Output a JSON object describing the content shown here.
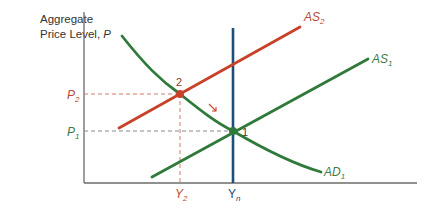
{
  "diagram": {
    "y_axis_title_line1": "Aggregate",
    "y_axis_title_line2": "Price Level, ",
    "y_axis_title_var": "P",
    "colors": {
      "axis": "#6b6b6b",
      "green": "#2f7a3a",
      "red": "#c8422a",
      "blue": "#1f4e7a",
      "dashed_red": "#d07a66",
      "dashed_gray": "#8a8a8a",
      "label_red": "#b94a35",
      "label_green": "#3f7a45",
      "label_blue": "#1f4e7a"
    },
    "curves": {
      "AS1": {
        "label": "AS",
        "sub": "1"
      },
      "AS2": {
        "label": "AS",
        "sub": "2"
      },
      "AD1": {
        "label": "AD",
        "sub": "1"
      },
      "Yn": {
        "label": "Y",
        "sub": "n"
      }
    },
    "y_ticks": {
      "P2": {
        "label": "P",
        "sub": "2"
      },
      "P1": {
        "label": "P",
        "sub": "1"
      }
    },
    "x_ticks": {
      "Y2": {
        "label": "Y",
        "sub": "2"
      },
      "Yn": {
        "label": "Y",
        "sub": "n"
      }
    },
    "points": {
      "p1": {
        "label": "1"
      },
      "p2": {
        "label": "2"
      }
    }
  }
}
